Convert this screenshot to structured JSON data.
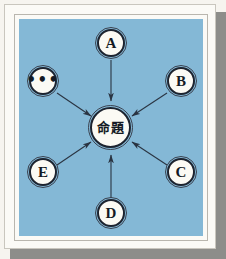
{
  "figure": {
    "title": "",
    "canvas_color": "#84b8d6",
    "paper_color": "#fbfaf6",
    "node_fill": "#fbfaf4",
    "node_stroke": "#1d2430",
    "edge_color": "#2a3442"
  },
  "diagram": {
    "type": "radial-star",
    "center": {
      "id": "center",
      "label": "命題",
      "name": "center-node-proposition"
    },
    "satellites": [
      {
        "id": "a",
        "label": "A",
        "position": "top",
        "edge_direction": "inbound"
      },
      {
        "id": "b",
        "label": "B",
        "position": "upper-right",
        "edge_direction": "inbound"
      },
      {
        "id": "c",
        "label": "C",
        "position": "lower-right",
        "edge_direction": "inbound"
      },
      {
        "id": "d",
        "label": "D",
        "position": "bottom",
        "edge_direction": "inbound"
      },
      {
        "id": "e",
        "label": "E",
        "position": "lower-left",
        "edge_direction": "inbound"
      },
      {
        "id": "dots",
        "label": "•••",
        "position": "upper-left",
        "edge_direction": "inbound"
      }
    ]
  }
}
